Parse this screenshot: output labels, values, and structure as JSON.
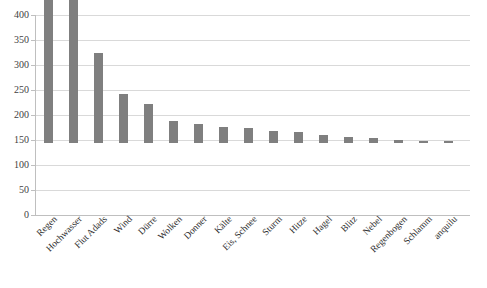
{
  "chart_data": {
    "type": "bar",
    "title": "",
    "subtitle": "",
    "xlabel": "",
    "ylabel": "",
    "ylim": [
      0,
      400
    ],
    "yticks": [
      0,
      50,
      100,
      150,
      200,
      250,
      300,
      350,
      400
    ],
    "grid": true,
    "legend": false,
    "legend_position": "none",
    "orientation": "vertical",
    "bar_color": "#7f7f7f",
    "gridline_color": "#d9d9d9",
    "axis_color": "#bfbfbf",
    "categories": [
      "Regen",
      "Hochwasser",
      "Flut Adads",
      "Wind",
      "Dürre",
      "Wolken",
      "Donner",
      "Kälte",
      "Eis, Schnee",
      "Sturm",
      "Hitze",
      "Hagel",
      "Blitz",
      "Nebel",
      "Regenbogen",
      "Schlamm",
      "anquilu"
    ],
    "values": [
      352,
      330,
      180,
      98,
      79,
      44,
      38,
      33,
      31,
      25,
      22,
      16,
      13,
      11,
      7,
      5,
      4
    ],
    "series": [
      {
        "name": "Häufigkeit",
        "values": [
          352,
          330,
          180,
          98,
          79,
          44,
          38,
          33,
          31,
          25,
          22,
          16,
          13,
          11,
          7,
          5,
          4
        ]
      }
    ]
  }
}
